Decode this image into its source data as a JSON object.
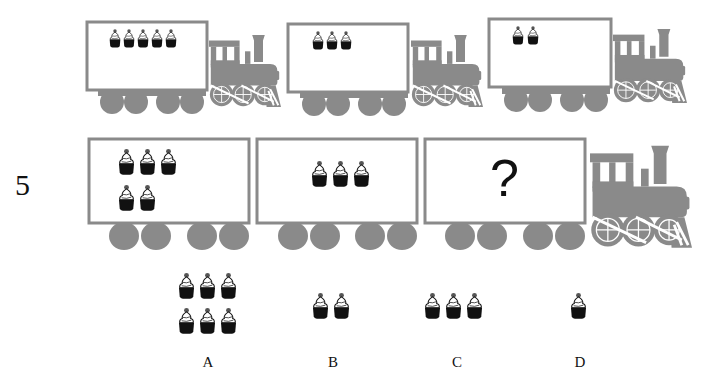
{
  "colors": {
    "train_gray": "#8a8a8a",
    "box_fill": "#ffffff",
    "cupcake_base": "#111111",
    "cupcake_cherry": "#555555",
    "text": "#111111"
  },
  "example_row": {
    "trains": [
      {
        "id": "train-1",
        "cupcakes": 5
      },
      {
        "id": "train-2",
        "cupcakes": 3
      },
      {
        "id": "train-3",
        "cupcakes": 2
      }
    ]
  },
  "question": {
    "number": "5",
    "cars": [
      {
        "id": "car-1",
        "cupcakes": 5
      },
      {
        "id": "car-2",
        "cupcakes": 3
      },
      {
        "id": "car-3",
        "content": "?"
      }
    ]
  },
  "options": [
    {
      "label": "A",
      "cupcakes": 6
    },
    {
      "label": "B",
      "cupcakes": 2
    },
    {
      "label": "C",
      "cupcakes": 3
    },
    {
      "label": "D",
      "cupcakes": 1
    }
  ]
}
